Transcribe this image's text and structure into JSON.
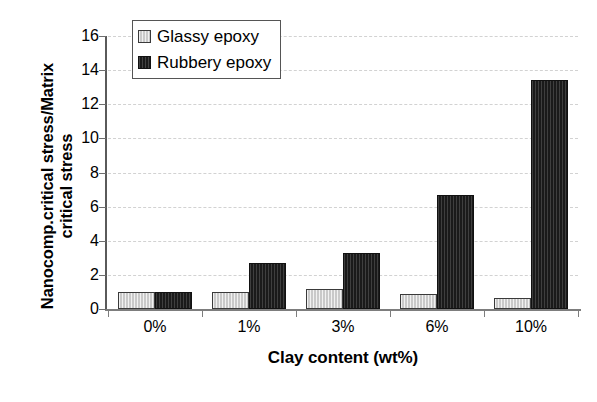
{
  "chart_data": {
    "type": "bar",
    "title": "",
    "xlabel": "Clay content (wt%)",
    "ylabel": "Nanocomp.critical stress/Matrix critical stress",
    "ylabel_lines": [
      "Nanocomp.critical stress/Matrix",
      "critical stress"
    ],
    "categories": [
      "0%",
      "1%",
      "3%",
      "6%",
      "10%"
    ],
    "series": [
      {
        "name": "Glassy epoxy",
        "color": "#c9c9c9",
        "values": [
          1.0,
          1.0,
          1.15,
          0.9,
          0.65
        ]
      },
      {
        "name": "Rubbery epoxy",
        "color": "#1a1a1a",
        "values": [
          1.0,
          2.7,
          3.3,
          6.7,
          13.4
        ]
      }
    ],
    "ylim": [
      0,
      16
    ],
    "y_ticks": [
      0,
      2,
      4,
      6,
      8,
      10,
      12,
      14,
      16
    ],
    "y_tick_labels": [
      "0",
      "2",
      "4",
      "6",
      "8",
      "10",
      "12",
      "14",
      "16"
    ],
    "grid": true,
    "grid_axis": "y",
    "legend_position": "top-left",
    "legend_entries": [
      "Glassy epoxy",
      "Rubbery epoxy"
    ]
  }
}
